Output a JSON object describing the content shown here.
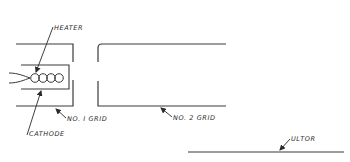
{
  "diagram": {
    "type": "electron-gun schematic",
    "labels": {
      "heater": "HEATER",
      "cathode": "CATHODE",
      "grid1": "NO. I GRID",
      "grid2": "NO. 2 GRID",
      "ultor": "ULTOR"
    },
    "components": [
      {
        "id": "heater",
        "label": "HEATER"
      },
      {
        "id": "cathode",
        "label": "CATHODE"
      },
      {
        "id": "grid1",
        "label": "NO. I GRID"
      },
      {
        "id": "grid2",
        "label": "NO. 2 GRID"
      },
      {
        "id": "ultor",
        "label": "ULTOR"
      }
    ],
    "colors": {
      "line": "#3a3a3a",
      "background": "#ffffff"
    }
  }
}
